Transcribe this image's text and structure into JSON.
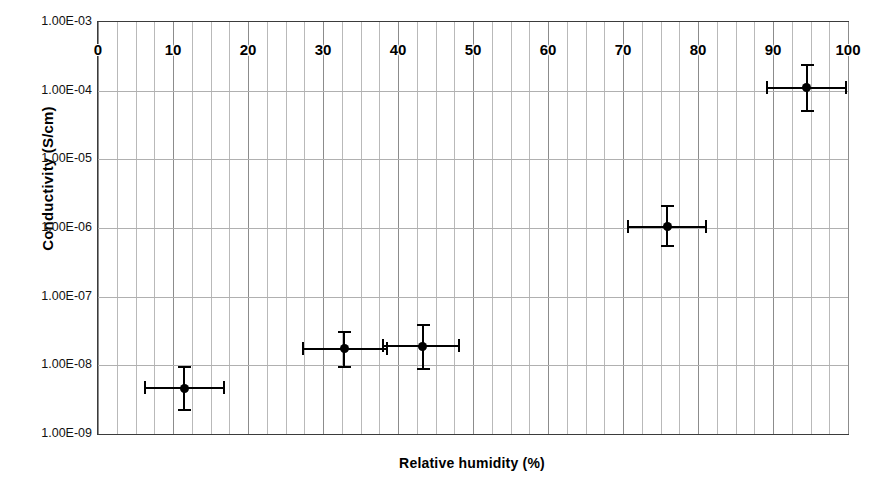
{
  "chart_data": {
    "type": "scatter",
    "title": "",
    "xlabel": "Relative humidity (%)",
    "ylabel": "Conductivity (S/cm)",
    "xlim": [
      0,
      100
    ],
    "ylim": [
      1e-09,
      0.001
    ],
    "yscale": "log",
    "grid": "both",
    "legend": "none",
    "xticks": [
      "0",
      "10",
      "20",
      "30",
      "40",
      "50",
      "60",
      "70",
      "80",
      "90",
      "100"
    ],
    "xtick_values": [
      0,
      10,
      20,
      30,
      40,
      50,
      60,
      70,
      80,
      90,
      100
    ],
    "xtick_position": "inside-top",
    "x_minor_gridline_step": 2.5,
    "yticks": [
      "1.00E-03",
      "1.00E-04",
      "1.00E-05",
      "1.00E-06",
      "1.00E-07",
      "1.00E-08",
      "1.00E-09"
    ],
    "ytick_values": [
      0.001,
      0.0001,
      1e-05,
      1e-06,
      1e-07,
      1e-08,
      1e-09
    ],
    "series": [
      {
        "name": "Conductivity",
        "marker": "filled-circle",
        "color": "#000000",
        "points": [
          {
            "x": 11.5,
            "y": 4.6e-09,
            "xerr_low": 6.2,
            "xerr_high": 16.8,
            "yerr_low": 2.2e-09,
            "yerr_high": 9.5e-09
          },
          {
            "x": 32.8,
            "y": 1.75e-08,
            "xerr_low": 27.3,
            "xerr_high": 38.5,
            "yerr_low": 9.5e-09,
            "yerr_high": 3.1e-08
          },
          {
            "x": 43.3,
            "y": 1.9e-08,
            "xerr_low": 38.0,
            "xerr_high": 48.1,
            "yerr_low": 8.7e-09,
            "yerr_high": 3.9e-08
          },
          {
            "x": 75.9,
            "y": 1.05e-06,
            "xerr_low": 70.7,
            "xerr_high": 81.1,
            "yerr_low": 5.4e-07,
            "yerr_high": 2.1e-06
          },
          {
            "x": 94.5,
            "y": 0.00011,
            "xerr_low": 89.2,
            "xerr_high": 99.7,
            "yerr_low": 5e-05,
            "yerr_high": 0.00024
          }
        ]
      }
    ]
  }
}
